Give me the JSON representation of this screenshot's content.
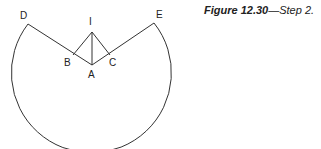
{
  "caption": {
    "figure_label": "Figure 12.30",
    "separator": "—",
    "text": "Step 2."
  },
  "diagram": {
    "points": {
      "D": {
        "label": "D",
        "x": 28,
        "y": 24
      },
      "E": {
        "label": "E",
        "x": 154,
        "y": 23
      },
      "I": {
        "label": "I",
        "x": 92,
        "y": 32
      },
      "A": {
        "label": "A",
        "x": 92,
        "y": 65
      },
      "B": {
        "label": "B",
        "x": 73,
        "y": 55
      },
      "C": {
        "label": "C",
        "x": 110,
        "y": 55
      }
    },
    "stroke_color": "#333333"
  }
}
